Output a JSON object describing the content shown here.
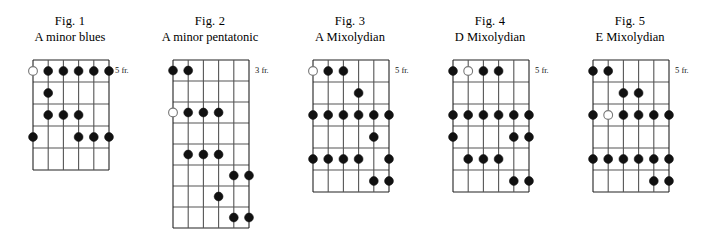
{
  "page": {
    "background": "#ffffff",
    "ink": "#000000",
    "note_fill": "#111111",
    "open_note_fill": "#ffffff",
    "grid_line_color": "#555555",
    "grid_border_color": "#222222"
  },
  "figures": [
    {
      "label": "Fig. 1",
      "name": "A minor blues",
      "position_label": "5 fr.",
      "strings": 6,
      "frets": 5,
      "grid_left": 33,
      "grid_top": 8,
      "grid_width": 76,
      "grid_height": 110,
      "notes": [
        {
          "string": 1,
          "fret": 1,
          "open": true
        },
        {
          "string": 2,
          "fret": 1,
          "open": false
        },
        {
          "string": 3,
          "fret": 1,
          "open": false
        },
        {
          "string": 4,
          "fret": 1,
          "open": false
        },
        {
          "string": 5,
          "fret": 1,
          "open": false
        },
        {
          "string": 6,
          "fret": 1,
          "open": false
        },
        {
          "string": 2,
          "fret": 2,
          "open": false
        },
        {
          "string": 2,
          "fret": 3,
          "open": false
        },
        {
          "string": 3,
          "fret": 3,
          "open": false
        },
        {
          "string": 4,
          "fret": 3,
          "open": false
        },
        {
          "string": 1,
          "fret": 4,
          "open": false
        },
        {
          "string": 4,
          "fret": 4,
          "open": false
        },
        {
          "string": 5,
          "fret": 4,
          "open": false
        },
        {
          "string": 6,
          "fret": 4,
          "open": false
        }
      ]
    },
    {
      "label": "Fig. 2",
      "name": "A minor pentatonic",
      "position_label": "3 fr.",
      "strings": 6,
      "frets": 8,
      "grid_left": 33,
      "grid_top": 8,
      "grid_width": 76,
      "grid_height": 168,
      "notes": [
        {
          "string": 1,
          "fret": 1,
          "open": false
        },
        {
          "string": 2,
          "fret": 1,
          "open": false
        },
        {
          "string": 1,
          "fret": 3,
          "open": true
        },
        {
          "string": 2,
          "fret": 3,
          "open": false
        },
        {
          "string": 3,
          "fret": 3,
          "open": false
        },
        {
          "string": 4,
          "fret": 3,
          "open": false
        },
        {
          "string": 2,
          "fret": 5,
          "open": false
        },
        {
          "string": 3,
          "fret": 5,
          "open": false
        },
        {
          "string": 4,
          "fret": 5,
          "open": false
        },
        {
          "string": 5,
          "fret": 6,
          "open": false
        },
        {
          "string": 6,
          "fret": 6,
          "open": false
        },
        {
          "string": 4,
          "fret": 7,
          "open": false
        },
        {
          "string": 5,
          "fret": 8,
          "open": false
        },
        {
          "string": 6,
          "fret": 8,
          "open": false
        }
      ]
    },
    {
      "label": "Fig. 3",
      "name": "A Mixolydian",
      "position_label": "5 fr.",
      "strings": 6,
      "frets": 6,
      "grid_left": 33,
      "grid_top": 8,
      "grid_width": 76,
      "grid_height": 132,
      "notes": [
        {
          "string": 1,
          "fret": 1,
          "open": true
        },
        {
          "string": 2,
          "fret": 1,
          "open": false
        },
        {
          "string": 3,
          "fret": 1,
          "open": false
        },
        {
          "string": 4,
          "fret": 2,
          "open": false
        },
        {
          "string": 1,
          "fret": 3,
          "open": false
        },
        {
          "string": 2,
          "fret": 3,
          "open": false
        },
        {
          "string": 3,
          "fret": 3,
          "open": false
        },
        {
          "string": 4,
          "fret": 3,
          "open": false
        },
        {
          "string": 5,
          "fret": 3,
          "open": false
        },
        {
          "string": 6,
          "fret": 3,
          "open": false
        },
        {
          "string": 5,
          "fret": 4,
          "open": false
        },
        {
          "string": 1,
          "fret": 5,
          "open": false
        },
        {
          "string": 2,
          "fret": 5,
          "open": false
        },
        {
          "string": 3,
          "fret": 5,
          "open": false
        },
        {
          "string": 4,
          "fret": 5,
          "open": false
        },
        {
          "string": 6,
          "fret": 5,
          "open": false
        },
        {
          "string": 5,
          "fret": 6,
          "open": false
        },
        {
          "string": 6,
          "fret": 6,
          "open": false
        }
      ]
    },
    {
      "label": "Fig. 4",
      "name": "D Mixolydian",
      "position_label": "5 fr.",
      "strings": 6,
      "frets": 6,
      "grid_left": 33,
      "grid_top": 8,
      "grid_width": 76,
      "grid_height": 132,
      "notes": [
        {
          "string": 1,
          "fret": 1,
          "open": false
        },
        {
          "string": 2,
          "fret": 1,
          "open": true
        },
        {
          "string": 3,
          "fret": 1,
          "open": false
        },
        {
          "string": 4,
          "fret": 1,
          "open": false
        },
        {
          "string": 1,
          "fret": 3,
          "open": false
        },
        {
          "string": 2,
          "fret": 3,
          "open": false
        },
        {
          "string": 3,
          "fret": 3,
          "open": false
        },
        {
          "string": 4,
          "fret": 3,
          "open": false
        },
        {
          "string": 5,
          "fret": 3,
          "open": false
        },
        {
          "string": 6,
          "fret": 3,
          "open": false
        },
        {
          "string": 1,
          "fret": 4,
          "open": false
        },
        {
          "string": 5,
          "fret": 4,
          "open": false
        },
        {
          "string": 6,
          "fret": 4,
          "open": false
        },
        {
          "string": 2,
          "fret": 5,
          "open": false
        },
        {
          "string": 3,
          "fret": 5,
          "open": false
        },
        {
          "string": 4,
          "fret": 5,
          "open": false
        },
        {
          "string": 5,
          "fret": 6,
          "open": false
        },
        {
          "string": 6,
          "fret": 6,
          "open": false
        }
      ]
    },
    {
      "label": "Fig. 5",
      "name": "E Mixolydian",
      "position_label": "5 fr.",
      "strings": 6,
      "frets": 6,
      "grid_left": 33,
      "grid_top": 8,
      "grid_width": 76,
      "grid_height": 132,
      "notes": [
        {
          "string": 1,
          "fret": 1,
          "open": false
        },
        {
          "string": 2,
          "fret": 1,
          "open": false
        },
        {
          "string": 3,
          "fret": 2,
          "open": false
        },
        {
          "string": 4,
          "fret": 2,
          "open": false
        },
        {
          "string": 1,
          "fret": 3,
          "open": false
        },
        {
          "string": 2,
          "fret": 3,
          "open": true
        },
        {
          "string": 3,
          "fret": 3,
          "open": false
        },
        {
          "string": 4,
          "fret": 3,
          "open": false
        },
        {
          "string": 5,
          "fret": 3,
          "open": false
        },
        {
          "string": 6,
          "fret": 3,
          "open": false
        },
        {
          "string": 1,
          "fret": 5,
          "open": false
        },
        {
          "string": 2,
          "fret": 5,
          "open": false
        },
        {
          "string": 3,
          "fret": 5,
          "open": false
        },
        {
          "string": 4,
          "fret": 5,
          "open": false
        },
        {
          "string": 5,
          "fret": 5,
          "open": false
        },
        {
          "string": 6,
          "fret": 5,
          "open": false
        },
        {
          "string": 5,
          "fret": 6,
          "open": false
        },
        {
          "string": 6,
          "fret": 6,
          "open": false
        }
      ]
    }
  ]
}
